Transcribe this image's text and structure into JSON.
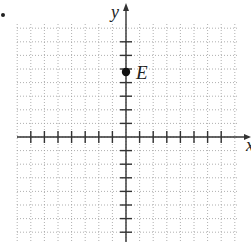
{
  "diagram": {
    "type": "coordinate-plane",
    "bullet": true,
    "axes": {
      "x_label": "x",
      "y_label": "y",
      "x_range": [
        -8,
        8
      ],
      "y_range": [
        -7,
        8
      ],
      "tick_step": 1
    },
    "points": [
      {
        "label": "E",
        "x": 0,
        "y": 5
      }
    ],
    "colors": {
      "axis": "#333333",
      "grid": "#9a9a9a",
      "point": "#111111",
      "label": "#222222"
    }
  }
}
